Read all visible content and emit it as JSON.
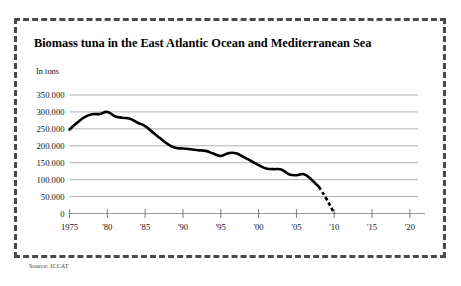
{
  "figure": {
    "title": "Biomass tuna in the East Atlantic Ocean and Mediterranean Sea",
    "unit_label": "In tons",
    "source": "Source: ICCAT",
    "frame_color": "#4a4a4a",
    "line_color": "#000000",
    "grid_color": "#8e8e8e",
    "background": "#ffffff"
  },
  "chart_data": {
    "type": "line",
    "title": "Biomass tuna in the East Atlantic Ocean and Mediterranean Sea",
    "subtitle": "",
    "xlabel": "",
    "ylabel": "In tons",
    "ylim": [
      0,
      350000
    ],
    "xlim": [
      1975,
      2022
    ],
    "grid": true,
    "legend": "none",
    "ytick_labels": [
      "0",
      "50.000",
      "100.000",
      "150.000",
      "200.000",
      "250.000",
      "300.000",
      "350.000"
    ],
    "ytick_values": [
      0,
      50000,
      100000,
      150000,
      200000,
      250000,
      300000,
      350000
    ],
    "xtick_labels": [
      "1975",
      "'80",
      "'85",
      "'90",
      "'95",
      "'00",
      "'05",
      "'10",
      "'15",
      "'20"
    ],
    "xtick_values": [
      1975,
      1980,
      1985,
      1990,
      1995,
      2000,
      2005,
      2010,
      2015,
      2020
    ],
    "series": [
      {
        "name": "Biomass (observed)",
        "style": "solid",
        "x": [
          1975,
          1976,
          1977,
          1978,
          1979,
          1980,
          1981,
          1982,
          1983,
          1984,
          1985,
          1986,
          1987,
          1988,
          1989,
          1990,
          1991,
          1992,
          1993,
          1994,
          1995,
          1996,
          1997,
          1998,
          1999,
          2000,
          2001,
          2002,
          2003,
          2004,
          2005,
          2006,
          2007,
          2008
        ],
        "values": [
          248000,
          268000,
          285000,
          293000,
          294000,
          300000,
          287000,
          283000,
          280000,
          268000,
          258000,
          240000,
          222000,
          205000,
          194000,
          192000,
          190000,
          187000,
          185000,
          177000,
          170000,
          178000,
          178000,
          167000,
          155000,
          143000,
          133000,
          131000,
          130000,
          116000,
          113000,
          116000,
          100000,
          78000
        ]
      },
      {
        "name": "Biomass (projected)",
        "style": "dashed",
        "x": [
          2008,
          2009,
          2010
        ],
        "values": [
          78000,
          42000,
          0
        ]
      }
    ]
  }
}
